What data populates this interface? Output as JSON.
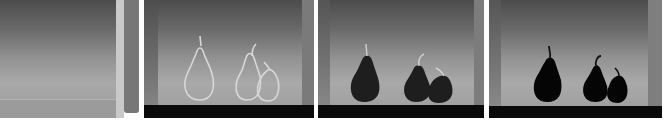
{
  "figure": {
    "panels": [
      {
        "index": 1,
        "content": "empty-background"
      },
      {
        "index": 2,
        "content": "pear-outlines"
      },
      {
        "index": 3,
        "content": "dark-pears-soft"
      },
      {
        "index": 4,
        "content": "black-pear-silhouettes"
      }
    ],
    "colors": {
      "floor": "#0a0a0a",
      "outline": "#d8d8d8",
      "pear_dark": "#1e1e1e",
      "pear_black": "#050505"
    }
  }
}
